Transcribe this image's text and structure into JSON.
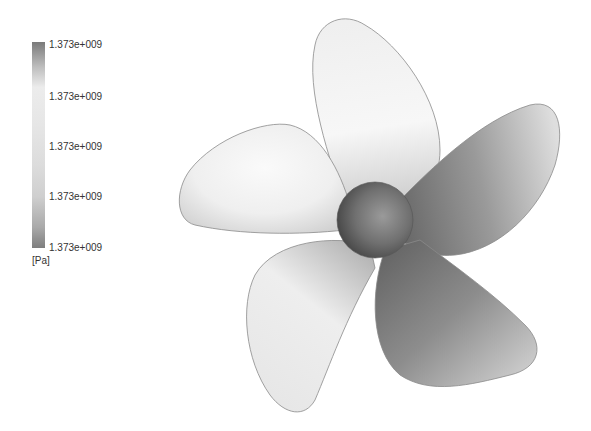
{
  "legend": {
    "labels": [
      "1.373e+009",
      "1.373e+009",
      "1.373e+009",
      "1.373e+009",
      "1.373e+009"
    ],
    "unit": "[Pa]"
  },
  "figure": {
    "blade_count": 5
  }
}
